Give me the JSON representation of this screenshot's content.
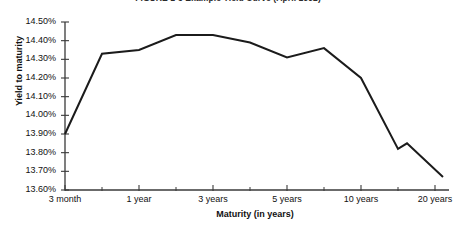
{
  "chart_data": {
    "type": "line",
    "title": "FIGURE 1-3   Example Yield Curve (April 1992)",
    "xlabel": "Maturity (in years)",
    "ylabel": "Yield to maturity",
    "grid": false,
    "legend": "none",
    "ylim": [
      13.6,
      14.5
    ],
    "ytick_labels": [
      "14.50%",
      "14.40%",
      "14.30%",
      "14.20%",
      "14.10%",
      "14.00%",
      "13.90%",
      "13.80%",
      "13.70%",
      "13.60%"
    ],
    "ytick_values": [
      14.5,
      14.4,
      14.3,
      14.2,
      14.1,
      14.0,
      13.9,
      13.8,
      13.7,
      13.6
    ],
    "xtick_labels": [
      "3 month",
      "1 year",
      "3 years",
      "5 years",
      "10 years",
      "20 years"
    ],
    "xtick_positions_px": [
      65,
      139,
      213,
      287,
      361,
      435
    ],
    "minor_xtick_positions_px": [
      102,
      176,
      250,
      324,
      398
    ],
    "x_maturity": [
      "3 month",
      "6 month",
      "1 year",
      "2 years",
      "3 years",
      "4 years",
      "5 years",
      "7 years",
      "10 years",
      "15 years",
      "20 years",
      "30 years"
    ],
    "values": [
      13.9,
      14.33,
      14.35,
      14.43,
      14.43,
      14.39,
      14.31,
      14.36,
      14.2,
      13.82,
      13.85,
      13.67
    ],
    "points_px": [
      {
        "x": 65,
        "y": 13.9
      },
      {
        "x": 102,
        "y": 14.33
      },
      {
        "x": 139,
        "y": 14.35
      },
      {
        "x": 176,
        "y": 14.43
      },
      {
        "x": 213,
        "y": 14.43
      },
      {
        "x": 250,
        "y": 14.39
      },
      {
        "x": 287,
        "y": 14.31
      },
      {
        "x": 324,
        "y": 14.36
      },
      {
        "x": 361,
        "y": 14.2
      },
      {
        "x": 398,
        "y": 13.82
      },
      {
        "x": 407,
        "y": 13.85
      },
      {
        "x": 443,
        "y": 13.67
      }
    ],
    "line_color": "#1b1b1b",
    "axis_color": "#3a3a3a",
    "background_color": "#ffffff"
  }
}
